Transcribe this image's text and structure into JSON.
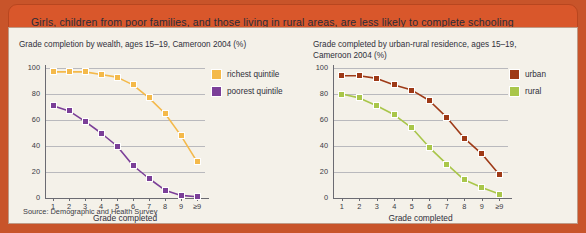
{
  "banner": {
    "text": "Girls, children from poor families, and those living in rural areas, are less likely to complete schooling"
  },
  "source": {
    "text": "Source: Demographic and Health Survey"
  },
  "colors": {
    "banner_bg": "#d9572b",
    "panel_bg": "#f4f1e9",
    "frame": "#c8542a",
    "richest": "#f4b94a",
    "poorest": "#7b3f98",
    "urban": "#9e3a17",
    "rural": "#a9c64a",
    "grid": "#b9b9bd",
    "axis": "#6b6b72",
    "text": "#2f2f3a"
  },
  "chart_data": [
    {
      "type": "line",
      "id": "wealth",
      "title": "Grade completion by wealth, ages 15–19, Cameroon 2004 (%)",
      "xlabel": "Grade completed",
      "ylabel": "",
      "categories": [
        "1",
        "2",
        "3",
        "4",
        "5",
        "6",
        "7",
        "8",
        "9",
        "≥9"
      ],
      "ylim": [
        0,
        100
      ],
      "yticks": [
        0,
        20,
        40,
        60,
        80,
        100
      ],
      "grid": true,
      "legend_position": "top-right",
      "series": [
        {
          "name": "richest quintile",
          "color": "#f4b94a",
          "values": [
            97,
            97,
            97,
            95,
            93,
            87,
            77,
            65,
            48,
            28
          ]
        },
        {
          "name": "poorest quintile",
          "color": "#7b3f98",
          "values": [
            71,
            67,
            59,
            50,
            40,
            25,
            15,
            6,
            2,
            1
          ]
        }
      ]
    },
    {
      "type": "line",
      "id": "residence",
      "title": "Grade completed by urban-rural residence, ages 15–19,\nCameroon 2004 (%)",
      "xlabel": "Grade completed",
      "ylabel": "",
      "categories": [
        "1",
        "2",
        "3",
        "4",
        "5",
        "6",
        "7",
        "8",
        "9",
        "≥9"
      ],
      "ylim": [
        0,
        100
      ],
      "yticks": [
        0,
        20,
        40,
        60,
        80,
        100
      ],
      "grid": true,
      "legend_position": "top-right",
      "series": [
        {
          "name": "urban",
          "color": "#9e3a17",
          "values": [
            94,
            94,
            92,
            87,
            83,
            75,
            62,
            46,
            34,
            18
          ]
        },
        {
          "name": "rural",
          "color": "#a9c64a",
          "values": [
            80,
            77,
            71,
            64,
            54,
            39,
            26,
            14,
            8,
            3
          ]
        }
      ]
    }
  ]
}
